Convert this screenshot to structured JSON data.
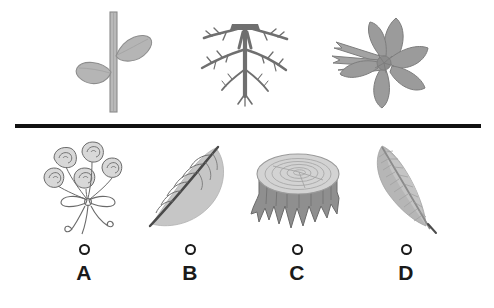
{
  "page": {
    "background_color": "#ffffff",
    "divider_color": "#111111"
  },
  "stimulus": {
    "items": [
      {
        "name": "stem-with-leaves",
        "label": "Stem with leaves",
        "color": "#9a9a9a"
      },
      {
        "name": "plant-roots",
        "label": "Plant roots",
        "color": "#7b7b7b"
      },
      {
        "name": "flower",
        "label": "Flower",
        "color": "#8f8f8f"
      }
    ]
  },
  "options": {
    "items": [
      {
        "letter": "A",
        "image_name": "bouquet-of-roses",
        "image_label": "Bouquet of roses tied with a ribbon",
        "selected": false
      },
      {
        "letter": "B",
        "image_name": "leaf",
        "image_label": "Leaf with midrib and veins",
        "selected": false
      },
      {
        "letter": "C",
        "image_name": "tree-stump",
        "image_label": "Tree stump with growth rings and roots",
        "selected": false
      },
      {
        "letter": "D",
        "image_name": "feather",
        "image_label": "Feather",
        "selected": false
      }
    ]
  }
}
